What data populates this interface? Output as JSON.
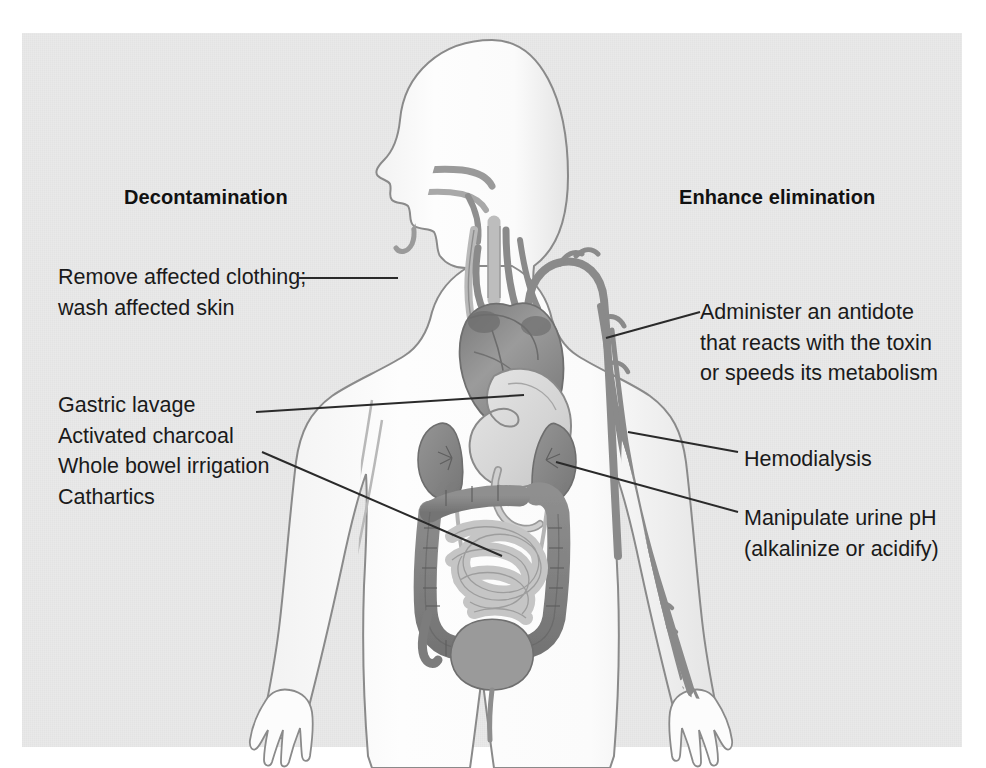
{
  "figure": {
    "background_color": "#e9e9e9",
    "panel_border_color": "#ffffff",
    "ink_color": "#1a1a1a"
  },
  "headings": {
    "left": "Decontamination",
    "right": "Enhance elimination"
  },
  "callouts": {
    "left": [
      {
        "id": "remove-clothing",
        "lines": [
          "Remove affected clothing;",
          "wash affected skin"
        ],
        "target": "skin / body surface"
      },
      {
        "id": "gi-decontamination",
        "lines": [
          "Gastric lavage",
          "Activated charcoal",
          "Whole bowel irrigation",
          "Cathartics"
        ],
        "target": "stomach and intestines"
      }
    ],
    "right": [
      {
        "id": "antidote",
        "lines": [
          "Administer an antidote",
          "that reacts with the toxin",
          "or speeds its metabolism"
        ],
        "target": "aorta / bloodstream"
      },
      {
        "id": "hemodialysis",
        "lines": [
          "Hemodialysis"
        ],
        "target": "arm vasculature"
      },
      {
        "id": "urine-ph",
        "lines": [
          "Manipulate urine pH",
          "(alkalinize or acidify)"
        ],
        "target": "kidney"
      }
    ]
  },
  "anatomy": {
    "organs": [
      {
        "name": "head-profile",
        "shade": "#fefefe"
      },
      {
        "name": "heart",
        "shade": "#8e8e8e"
      },
      {
        "name": "aorta",
        "shade": "#8a8a8a"
      },
      {
        "name": "esophagus",
        "shade": "#cfcfcf"
      },
      {
        "name": "stomach",
        "shade": "#dcdcdc"
      },
      {
        "name": "kidney-left",
        "shade": "#8b8b8b"
      },
      {
        "name": "kidney-right",
        "shade": "#8b8b8b"
      },
      {
        "name": "large-intestine",
        "shade": "#8a8a8a"
      },
      {
        "name": "small-intestine",
        "shade": "#c8c8c8"
      },
      {
        "name": "bladder",
        "shade": "#9a9a9a"
      },
      {
        "name": "arm-vasculature",
        "shade": "#8a8a8a"
      }
    ]
  }
}
